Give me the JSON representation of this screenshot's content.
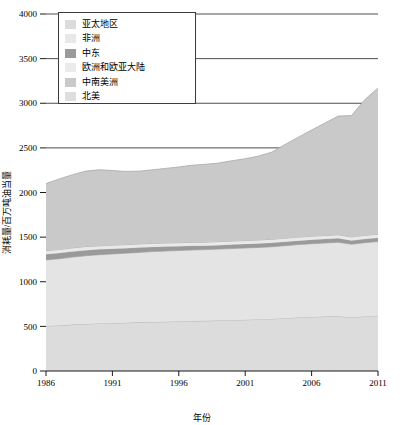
{
  "chart_data": {
    "type": "area",
    "stacked": true,
    "title": "",
    "xlabel": "年份",
    "ylabel": "消耗量/百万吨油当量",
    "xlim": [
      1986,
      2011
    ],
    "ylim": [
      0,
      4000
    ],
    "yticks": [
      0,
      500,
      1000,
      1500,
      2000,
      2500,
      3000,
      3500,
      4000
    ],
    "xticks": [
      1986,
      1991,
      1996,
      2001,
      2006,
      2011
    ],
    "grid": "horizontal-partial",
    "legend_position": "top-left",
    "x": [
      1986,
      1987,
      1988,
      1989,
      1990,
      1991,
      1992,
      1993,
      1994,
      1995,
      1996,
      1997,
      1998,
      1999,
      2000,
      2001,
      2002,
      2003,
      2004,
      2005,
      2006,
      2007,
      2008,
      2009,
      2010,
      2011
    ],
    "series": [
      {
        "name": "亚太地区",
        "color": "#dcdcdc",
        "values": [
          505,
          510,
          520,
          528,
          533,
          536,
          540,
          545,
          550,
          552,
          556,
          560,
          562,
          566,
          570,
          574,
          578,
          584,
          592,
          600,
          606,
          610,
          614,
          600,
          612,
          620
        ]
      },
      {
        "name": "非洲",
        "color": "#e4e4e4",
        "values": [
          740,
          748,
          756,
          764,
          770,
          776,
          780,
          784,
          788,
          792,
          794,
          796,
          798,
          800,
          802,
          804,
          806,
          808,
          812,
          816,
          820,
          824,
          828,
          820,
          826,
          830
        ]
      },
      {
        "name": "中东",
        "color": "#9a9a9a",
        "values": [
          64,
          64,
          64,
          62,
          60,
          58,
          56,
          54,
          52,
          50,
          48,
          46,
          44,
          44,
          44,
          44,
          44,
          44,
          44,
          44,
          44,
          44,
          44,
          42,
          42,
          42
        ]
      },
      {
        "name": "欧洲和欧亚大陆",
        "color": "#e9e9e9",
        "values": [
          40,
          40,
          40,
          40,
          40,
          40,
          40,
          40,
          40,
          40,
          40,
          40,
          40,
          40,
          40,
          40,
          40,
          40,
          40,
          40,
          40,
          40,
          40,
          40,
          40,
          40
        ]
      },
      {
        "name": "中南美洲",
        "color": "#c9c9c9",
        "values": [
          751,
          790,
          820,
          846,
          852,
          836,
          820,
          816,
          824,
          836,
          848,
          864,
          872,
          880,
          900,
          916,
          940,
          976,
          1050,
          1120,
          1190,
          1260,
          1330,
          1360,
          1520,
          1640
        ]
      },
      {
        "name": "北美",
        "color": "#d2d2d2",
        "values": [
          0,
          0,
          0,
          0,
          0,
          0,
          0,
          0,
          0,
          0,
          0,
          0,
          0,
          0,
          0,
          0,
          0,
          0,
          0,
          0,
          0,
          0,
          0,
          0,
          0,
          0
        ]
      }
    ],
    "stack_tops": [
      2100,
      2152,
      2200,
      2240,
      2255,
      2246,
      2236,
      2239,
      2254,
      2270,
      2286,
      2306,
      2316,
      2330,
      2356,
      2378,
      2408,
      2452,
      2538,
      2620,
      2700,
      2778,
      2856,
      2862,
      3040,
      3172
    ],
    "annotations": []
  },
  "legend": {
    "items": [
      {
        "label": "亚太地区",
        "color": "#dcdcdc"
      },
      {
        "label": "非洲",
        "color": "#e8e8e8"
      },
      {
        "label": "中东",
        "color": "#9a9a9a"
      },
      {
        "label": "欧洲和欧亚大陆",
        "color": "#ebebeb"
      },
      {
        "label": "中南美洲",
        "color": "#c9c9c9"
      },
      {
        "label": "北美",
        "color": "#dedede"
      }
    ]
  },
  "axes": {
    "y_title": "消耗量/百万吨油当量",
    "x_title": "年份",
    "y_tick_labels": [
      "0",
      "500",
      "1000",
      "1500",
      "2000",
      "2500",
      "3000",
      "3500",
      "4000"
    ],
    "x_tick_labels": [
      "1986",
      "1991",
      "1996",
      "2001",
      "2006",
      "2011"
    ]
  }
}
